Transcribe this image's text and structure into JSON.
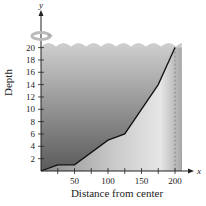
{
  "chart_data": {
    "type": "area",
    "title": "",
    "xlabel": "Distance from center",
    "ylabel": "Depth",
    "x_axis_var": "x",
    "y_axis_var": "y",
    "xlim": [
      0,
      210
    ],
    "ylim": [
      0,
      22
    ],
    "x_ticks": [
      25,
      50,
      75,
      100,
      125,
      150,
      175,
      200
    ],
    "x_tick_labels": [
      "50",
      "100",
      "150",
      "200"
    ],
    "x_tick_label_values": [
      50,
      100,
      150,
      200
    ],
    "y_ticks": [
      2,
      4,
      6,
      8,
      10,
      12,
      14,
      16,
      18,
      20
    ],
    "y_tick_labels": [
      "2",
      "4",
      "6",
      "8",
      "10",
      "12",
      "14",
      "16",
      "18",
      "20"
    ],
    "series": [
      {
        "name": "Depth profile",
        "x": [
          0,
          25,
          50,
          100,
          125,
          175,
          200
        ],
        "y": [
          0,
          1,
          1,
          5,
          6,
          14,
          20
        ]
      }
    ],
    "annotations": [
      "rotation-arrow-icon about y-axis",
      "dashed vertical line at x=200",
      "wavy water surface at y=20"
    ],
    "grid": false,
    "legend": "none"
  },
  "colors": {
    "water_top": "#c9c9c9",
    "water_bottom": "#5e5e5e",
    "ground_light": "#e4e4e4",
    "ground_dark": "#9a9a9a",
    "line": "#111111",
    "axis": "#222222"
  }
}
